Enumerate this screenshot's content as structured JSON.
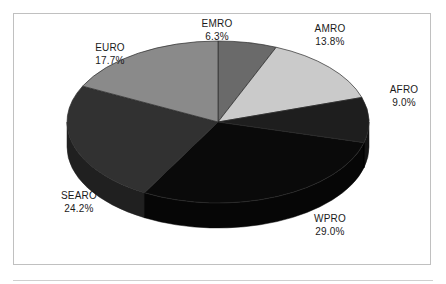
{
  "figure": {
    "background_color": "#ffffff",
    "frame_color": "#c0c0c0"
  },
  "chart_data": {
    "type": "pie",
    "title": "",
    "subtitle": "",
    "xlabel": "",
    "ylabel": "",
    "legend_position": "none",
    "grid": false,
    "label_format": "name above percent",
    "start_angle_deg": 0,
    "direction": "clockwise",
    "three_d": true,
    "depth_px": 25,
    "categories": [
      "EMRO",
      "AMRO",
      "AFRO",
      "WPRO",
      "SEARO",
      "EURO"
    ],
    "values": [
      6.3,
      13.8,
      9.0,
      29.0,
      24.2,
      17.7
    ],
    "total": 100.0,
    "units": "percent",
    "slices": [
      {
        "name": "EMRO",
        "value": 6.3,
        "value_label": "6.3%",
        "color": "#6a6a6a",
        "side_color": "#4e4e4e",
        "label_x": 217,
        "label_y": 27,
        "value_x": 217,
        "value_y": 40
      },
      {
        "name": "AMRO",
        "value": 13.8,
        "value_label": "13.8%",
        "color": "#cacaca",
        "side_color": "#9d9d9d",
        "label_x": 330,
        "label_y": 32,
        "value_x": 330,
        "value_y": 45
      },
      {
        "name": "AFRO",
        "value": 9.0,
        "value_label": "9.0%",
        "color": "#1e1e1e",
        "side_color": "#141414",
        "label_x": 404,
        "label_y": 93,
        "value_x": 404,
        "value_y": 106
      },
      {
        "name": "WPRO",
        "value": 29.0,
        "value_label": "29.0%",
        "color": "#0a0a0a",
        "side_color": "#060606",
        "label_x": 330,
        "label_y": 222,
        "value_x": 330,
        "value_y": 235
      },
      {
        "name": "SEARO",
        "value": 24.2,
        "value_label": "24.2%",
        "color": "#313131",
        "side_color": "#202020",
        "label_x": 79,
        "label_y": 199,
        "value_x": 79,
        "value_y": 212
      },
      {
        "name": "EURO",
        "value": 17.7,
        "value_label": "17.7%",
        "color": "#8a8a8a",
        "side_color": "#636363",
        "label_x": 110,
        "label_y": 51,
        "value_x": 110,
        "value_y": 64
      }
    ],
    "geometry": {
      "center_x": 218,
      "center_y": 122,
      "radius_x": 151,
      "radius_y": 81,
      "depth": 25
    }
  }
}
